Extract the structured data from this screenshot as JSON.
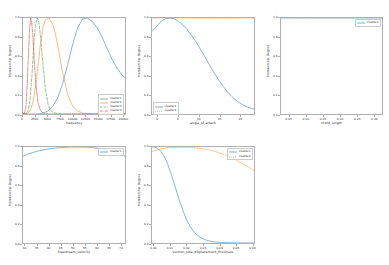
{
  "figure": {
    "type": "matplotlib-subplot-grid",
    "rows": 2,
    "cols": 3,
    "background": "#ffffff",
    "empty_cells": [
      "row2-col3"
    ],
    "shared_ylabel": "Membership Degree",
    "colors": {
      "cluster1": "#1f77b4",
      "cluster2": "#ff7f0e",
      "cluster3": "#2ca02c",
      "cluster4": "#d62728",
      "axis": "#b0b0b0",
      "text": "#2b2b2b"
    }
  },
  "chart_data": [
    {
      "id": "plot-frequency",
      "type": "line",
      "title": "",
      "xlabel": "frequency",
      "ylabel": "Membership Degree",
      "xlim": [
        0,
        20500
      ],
      "ylim": [
        0.0,
        1.0
      ],
      "grid": false,
      "legend_position": "lower right",
      "xticks": [
        0,
        2500,
        5000,
        7500,
        10000,
        12500,
        15000,
        17500,
        20000
      ],
      "xticklabels": [
        "0",
        "2500",
        "5000",
        "7500",
        "10000",
        "12500",
        "15000",
        "17500",
        "20000"
      ],
      "yticks": [
        0.0,
        0.2,
        0.4,
        0.6,
        0.8,
        1.0
      ],
      "yticklabels": [
        "0.0",
        "0.2",
        "0.4",
        "0.6",
        "0.8",
        "1.0"
      ],
      "series": [
        {
          "name": "cluster1",
          "color": "#1f77b4",
          "dash": "solid",
          "center": 12900,
          "width": 4600,
          "x": [
            0,
            1000,
            2000,
            3000,
            4000,
            5000,
            6000,
            7000,
            8000,
            9000,
            10000,
            11000,
            12000,
            12900,
            14000,
            15000,
            16000,
            17000,
            18000,
            19000,
            20000,
            20500
          ],
          "y": [
            0.0,
            0.0,
            0.0,
            0.0,
            0.01,
            0.03,
            0.08,
            0.17,
            0.32,
            0.52,
            0.73,
            0.9,
            0.99,
            1.0,
            0.96,
            0.89,
            0.79,
            0.67,
            0.56,
            0.47,
            0.4,
            0.38
          ]
        },
        {
          "name": "cluster2",
          "color": "#ff7f0e",
          "dash": "solid",
          "center": 5200,
          "width": 2300,
          "x": [
            0,
            500,
            1000,
            1500,
            2000,
            2500,
            3000,
            3500,
            4000,
            4500,
            5200,
            6000,
            6500,
            7000,
            7500,
            8000,
            9000,
            10000,
            11000,
            12000,
            14000,
            16000,
            18000,
            20500
          ],
          "y": [
            0.0,
            0.0,
            0.01,
            0.04,
            0.12,
            0.28,
            0.5,
            0.72,
            0.9,
            0.98,
            1.0,
            0.93,
            0.84,
            0.71,
            0.56,
            0.42,
            0.2,
            0.08,
            0.03,
            0.01,
            0.0,
            0.0,
            0.0,
            0.0
          ]
        },
        {
          "name": "cluster3",
          "color": "#2ca02c",
          "dash": "dashed",
          "center": 2900,
          "width": 1050,
          "x": [
            0,
            500,
            1000,
            1400,
            1800,
            2200,
            2500,
            2900,
            3200,
            3600,
            4000,
            4500,
            5000,
            5500,
            6000,
            7000,
            8000,
            10000,
            12000,
            16000,
            20500
          ],
          "y": [
            0.0,
            0.0,
            0.03,
            0.14,
            0.4,
            0.76,
            0.93,
            1.0,
            0.95,
            0.77,
            0.52,
            0.26,
            0.11,
            0.04,
            0.02,
            0.0,
            0.0,
            0.0,
            0.0,
            0.0,
            0.0
          ]
        },
        {
          "name": "cluster4",
          "color": "#d62728",
          "dash": "dashdot",
          "center": 1550,
          "width": 700,
          "x": [
            0,
            300,
            600,
            900,
            1100,
            1300,
            1550,
            1800,
            2000,
            2300,
            2600,
            3000,
            3500,
            4000,
            5000,
            6000,
            8000,
            12000,
            20500
          ],
          "y": [
            0.0,
            0.01,
            0.08,
            0.36,
            0.62,
            0.87,
            1.0,
            0.93,
            0.8,
            0.53,
            0.3,
            0.12,
            0.04,
            0.01,
            0.0,
            0.0,
            0.0,
            0.0,
            0.0
          ]
        }
      ]
    },
    {
      "id": "plot-angle-of-attack",
      "type": "line",
      "title": "",
      "xlabel": "angle_of_attack",
      "ylabel": "Membership Degree",
      "xlim": [
        -1.5,
        23.5
      ],
      "ylim": [
        0.0,
        1.0
      ],
      "grid": false,
      "legend_position": "lower left",
      "xticks": [
        0,
        5,
        10,
        15,
        20
      ],
      "xticklabels": [
        "0",
        "5",
        "10",
        "15",
        "20"
      ],
      "yticks": [
        0.0,
        0.2,
        0.4,
        0.6,
        0.8,
        1.0
      ],
      "yticklabels": [
        "0.0",
        "0.2",
        "0.4",
        "0.6",
        "0.8",
        "1.0"
      ],
      "series": [
        {
          "name": "cluster1",
          "color": "#1f77b4",
          "dash": "solid",
          "x": [
            -1.5,
            0,
            1,
            2,
            3,
            4,
            5,
            6,
            7,
            8,
            9,
            10,
            11,
            12,
            13,
            14,
            15,
            16,
            17,
            18,
            19,
            20,
            21,
            22,
            23.5
          ],
          "y": [
            0.86,
            0.93,
            0.975,
            0.995,
            1.0,
            0.99,
            0.965,
            0.93,
            0.885,
            0.83,
            0.77,
            0.7,
            0.63,
            0.555,
            0.48,
            0.41,
            0.345,
            0.285,
            0.23,
            0.185,
            0.145,
            0.115,
            0.09,
            0.07,
            0.05
          ]
        },
        {
          "name": "cluster2",
          "color": "#ff7f0e",
          "dash": "dotted",
          "x": [
            -1.5,
            0,
            5,
            10,
            15,
            20,
            23.5
          ],
          "y": [
            1.0,
            1.0,
            1.0,
            1.0,
            1.0,
            1.0,
            1.0
          ]
        }
      ]
    },
    {
      "id": "plot-chord-length",
      "type": "line",
      "title": "",
      "xlabel": "chord_length",
      "ylabel": "Membership Degree",
      "xlim": [
        0.025,
        0.325
      ],
      "ylim": [
        0.0,
        1.0
      ],
      "grid": false,
      "legend_position": "upper right",
      "xticks": [
        0.05,
        0.1,
        0.15,
        0.2,
        0.25,
        0.3
      ],
      "xticklabels": [
        "0.05",
        "0.10",
        "0.15",
        "0.20",
        "0.25",
        "0.30"
      ],
      "yticks": [
        0.0,
        0.2,
        0.4,
        0.6,
        0.8,
        1.0
      ],
      "yticklabels": [
        "0.0",
        "0.2",
        "0.4",
        "0.6",
        "0.8",
        "1.0"
      ],
      "series": [
        {
          "name": "cluster1",
          "color": "#1f77b4",
          "dash": "solid",
          "x": [
            0.025,
            0.05,
            0.1,
            0.15,
            0.2,
            0.25,
            0.3,
            0.325
          ],
          "y": [
            1.0,
            1.0,
            1.0,
            1.0,
            1.0,
            1.0,
            1.0,
            1.0
          ]
        }
      ]
    },
    {
      "id": "plot-freestream-velocity",
      "type": "line",
      "title": "",
      "xlabel": "freestream_velocity",
      "ylabel": "Membership Degree",
      "xlim": [
        29,
        72
      ],
      "ylim": [
        0.0,
        1.0
      ],
      "grid": false,
      "legend_position": "upper right",
      "xticks": [
        30,
        35,
        40,
        45,
        50,
        55,
        60,
        65,
        70
      ],
      "xticklabels": [
        "30",
        "35",
        "40",
        "45",
        "50",
        "55",
        "60",
        "65",
        "70"
      ],
      "yticks": [
        0.0,
        0.2,
        0.4,
        0.6,
        0.8,
        1.0
      ],
      "yticklabels": [
        "0.0",
        "0.2",
        "0.4",
        "0.6",
        "0.8",
        "1.0"
      ],
      "series": [
        {
          "name": "cluster1",
          "color": "#1f77b4",
          "dash": "solid",
          "x": [
            29,
            31,
            33,
            35,
            38,
            41,
            44,
            47,
            50,
            53,
            56,
            58,
            60,
            62,
            64,
            66,
            68,
            70,
            72
          ],
          "y": [
            0.905,
            0.925,
            0.942,
            0.956,
            0.972,
            0.984,
            0.992,
            0.997,
            1.0,
            1.0,
            0.998,
            0.994,
            0.988,
            0.979,
            0.968,
            0.955,
            0.94,
            0.924,
            0.906
          ]
        }
      ]
    },
    {
      "id": "plot-suction-side-displacement-thickness",
      "type": "line",
      "title": "",
      "xlabel": "suction_side_displacement_thickness",
      "ylabel": "Membership Degree",
      "xlim": [
        -0.0015,
        0.0615
      ],
      "ylim": [
        0.0,
        1.0
      ],
      "grid": false,
      "legend_position": "upper right",
      "xticks": [
        0.0,
        0.01,
        0.02,
        0.03,
        0.04,
        0.05,
        0.06
      ],
      "xticklabels": [
        "0.00",
        "0.01",
        "0.02",
        "0.03",
        "0.04",
        "0.05",
        "0.06"
      ],
      "yticks": [
        0.0,
        0.2,
        0.4,
        0.6,
        0.8,
        1.0
      ],
      "yticklabels": [
        "0.0",
        "0.2",
        "0.4",
        "0.6",
        "0.8",
        "1.0"
      ],
      "series": [
        {
          "name": "cluster1",
          "color": "#1f77b4",
          "dash": "solid",
          "x": [
            -0.0015,
            0.0,
            0.002,
            0.004,
            0.006,
            0.008,
            0.01,
            0.012,
            0.014,
            0.016,
            0.018,
            0.02,
            0.022,
            0.024,
            0.026,
            0.028,
            0.03,
            0.033,
            0.036,
            0.04,
            0.045,
            0.05,
            0.055,
            0.0615
          ],
          "y": [
            1.0,
            1.0,
            0.985,
            0.955,
            0.905,
            0.83,
            0.735,
            0.63,
            0.52,
            0.415,
            0.32,
            0.24,
            0.175,
            0.125,
            0.088,
            0.062,
            0.043,
            0.024,
            0.014,
            0.006,
            0.002,
            0.001,
            0.0,
            0.0
          ]
        },
        {
          "name": "cluster2",
          "color": "#ff7f0e",
          "dash": "dotted",
          "x": [
            -0.0015,
            0.0,
            0.004,
            0.008,
            0.012,
            0.016,
            0.02,
            0.024,
            0.028,
            0.032,
            0.036,
            0.04,
            0.044,
            0.048,
            0.052,
            0.056,
            0.0615
          ],
          "y": [
            0.955,
            0.962,
            0.98,
            0.992,
            0.998,
            1.0,
            0.999,
            0.995,
            0.987,
            0.976,
            0.96,
            0.94,
            0.915,
            0.885,
            0.85,
            0.81,
            0.755
          ]
        }
      ]
    }
  ]
}
